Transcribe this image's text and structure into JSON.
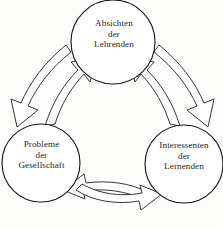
{
  "diagram": {
    "type": "cycle-diagram",
    "language": "de",
    "background_color": "#fdfdfc",
    "stroke_color": "#1a1a1a",
    "nodes": [
      {
        "id": "top",
        "shape": "circle",
        "cx": 113,
        "cy": 42,
        "r": 42,
        "lines": [
          "Absichten",
          "der",
          "Lehrenden"
        ]
      },
      {
        "id": "left",
        "shape": "circle",
        "cx": 41,
        "cy": 163,
        "r": 39,
        "lines": [
          "Probleme",
          "der",
          "Gesellschaft"
        ]
      },
      {
        "id": "right",
        "shape": "circle",
        "cx": 184,
        "cy": 164,
        "r": 39,
        "lines": [
          "Interessenten",
          "der",
          "Lernenden"
        ]
      }
    ],
    "connectors": [
      {
        "id": "top-to-left",
        "from": "top",
        "to": "left",
        "style": "curved-hollow-arrow",
        "direction": "down-left"
      },
      {
        "id": "left-to-top",
        "from": "left",
        "to": "top",
        "style": "curved-hollow-arrow",
        "direction": "up-right"
      },
      {
        "id": "top-to-right",
        "from": "top",
        "to": "right",
        "style": "curved-hollow-arrow",
        "direction": "down-right"
      },
      {
        "id": "right-to-top",
        "from": "right",
        "to": "top",
        "style": "curved-hollow-arrow",
        "direction": "up-left"
      },
      {
        "id": "left-to-right",
        "from": "left",
        "to": "right",
        "style": "curved-hollow-arrow",
        "direction": "right"
      },
      {
        "id": "right-to-left",
        "from": "right",
        "to": "left",
        "style": "curved-hollow-arrow",
        "direction": "left"
      }
    ],
    "bottom_artifact": ""
  }
}
